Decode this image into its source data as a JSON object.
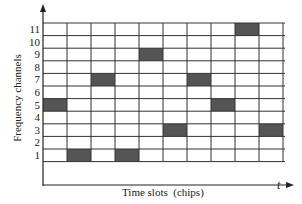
{
  "title": "",
  "axes": {
    "ylabel": "Frequency channels",
    "xlabel": "Time slots  (chips)",
    "x_axis_symbol": "t",
    "y_ticks": [
      "1",
      "2",
      "3",
      "4",
      "5",
      "6",
      "7",
      "8",
      "9",
      "10",
      "11"
    ]
  },
  "chart_data": {
    "type": "heatmap",
    "title": "",
    "xlabel": "Time slots  (chips)",
    "ylabel": "Frequency channels",
    "x_axis_symbol": "t",
    "x": [
      1,
      2,
      3,
      4,
      5,
      6,
      7,
      8,
      9,
      10
    ],
    "y": [
      1,
      2,
      3,
      4,
      5,
      6,
      7,
      8,
      9,
      10,
      11
    ],
    "hops": [
      {
        "slot": 1,
        "channel": 5
      },
      {
        "slot": 2,
        "channel": 1
      },
      {
        "slot": 3,
        "channel": 7
      },
      {
        "slot": 4,
        "channel": 1
      },
      {
        "slot": 5,
        "channel": 9
      },
      {
        "slot": 6,
        "channel": 3
      },
      {
        "slot": 7,
        "channel": 7
      },
      {
        "slot": 8,
        "channel": 5
      },
      {
        "slot": 9,
        "channel": 11
      },
      {
        "slot": 10,
        "channel": 3
      }
    ],
    "grid": true,
    "fill_color": "#555555",
    "grid_color": "#333333"
  }
}
